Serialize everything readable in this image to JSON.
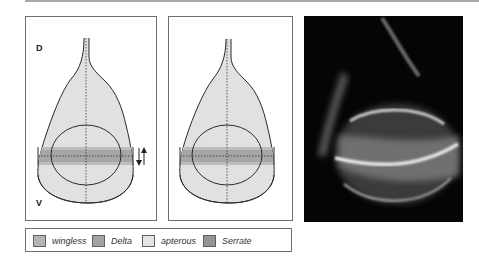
{
  "figure": {
    "panel_left": {
      "label_top": "D",
      "label_bottom": "V",
      "arrows": "down-up arrows indicating D/V signaling"
    },
    "panel_middle": {},
    "photo": {
      "description": "fluorescence micrograph of wing imaginal disc"
    }
  },
  "legend": {
    "items": [
      {
        "label": "wingless",
        "color": "#b4b4b4"
      },
      {
        "label": "Delta",
        "color": "#a3a3a3"
      },
      {
        "label": "apterous",
        "color": "#e4e4e4"
      },
      {
        "label": "Serrate",
        "color": "#949494"
      }
    ]
  },
  "colors": {
    "disc_fill": "#e1e1e1",
    "band_outer": "#bdbdbd",
    "band_inner": "#a6a6a6",
    "outline": "#2a2a2a"
  }
}
